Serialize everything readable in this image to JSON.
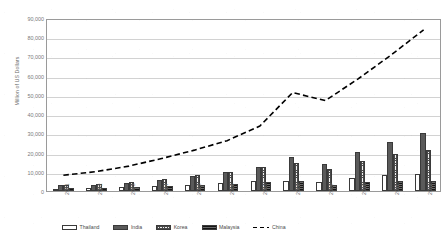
{
  "chart_data": {
    "type": "bar",
    "title": "",
    "xlabel": "",
    "ylabel": "Million of US Dollars",
    "ylim": [
      0,
      90000
    ],
    "ytick_step": 10000,
    "yticks": [
      "0",
      "10,000",
      "20,000",
      "30,000",
      "40,000",
      "50,000",
      "60,000",
      "70,000",
      "80,000",
      "90,000"
    ],
    "grid": true,
    "legend_position": "bottom",
    "categories": [
      "2001",
      "2002",
      "2003",
      "2004",
      "2005",
      "2006",
      "2007",
      "2008",
      "2009",
      "2010",
      "2011",
      "2012"
    ],
    "series": [
      {
        "name": "Thailand",
        "type": "bar",
        "fill": "white",
        "values": [
          1300,
          1600,
          2000,
          2600,
          3300,
          4100,
          5000,
          5300,
          4800,
          6800,
          8300,
          8700
        ]
      },
      {
        "name": "India",
        "type": "bar",
        "fill": "dotted-dark",
        "values": [
          2900,
          3300,
          4200,
          5600,
          8000,
          9700,
          12500,
          17700,
          14000,
          20500,
          25600,
          30100
        ]
      },
      {
        "name": "Korea",
        "type": "bar",
        "fill": "checkered-light",
        "values": [
          3200,
          3600,
          4500,
          6400,
          8300,
          9900,
          12600,
          14700,
          11300,
          15600,
          19500,
          21300
        ]
      },
      {
        "name": "Malaysia",
        "type": "bar",
        "fill": "striped-dark",
        "values": [
          1700,
          1500,
          1900,
          2700,
          3300,
          3900,
          4600,
          5000,
          3000,
          4500,
          5200,
          5100
        ]
      },
      {
        "name": "China",
        "type": "line",
        "style": "dashed",
        "values": [
          8300,
          10200,
          13100,
          17100,
          21500,
          26500,
          34200,
          51800,
          47600,
          59000,
          71500,
          84800
        ]
      }
    ],
    "legend_entries": [
      {
        "label": "Thailand",
        "marker": "bar-swatch-white"
      },
      {
        "label": "India",
        "marker": "bar-swatch-dotted"
      },
      {
        "label": "Korea",
        "marker": "bar-swatch-checkered"
      },
      {
        "label": "Malaysia",
        "marker": "bar-swatch-striped"
      },
      {
        "label": "China",
        "marker": "dashed-line"
      }
    ]
  }
}
